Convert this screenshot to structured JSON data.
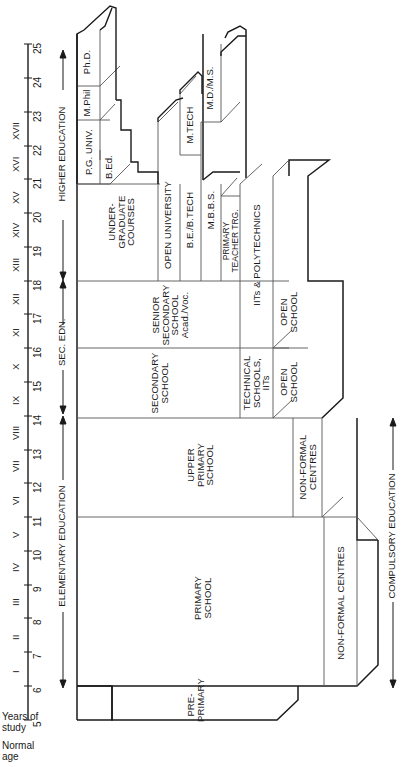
{
  "axis": {
    "years_label": "Years of\nstudy",
    "age_label": "Normal\nage",
    "ages": [
      "5",
      "6",
      "7",
      "8",
      "9",
      "10",
      "11",
      "12",
      "13",
      "14",
      "15",
      "16",
      "17",
      "18",
      "19",
      "20",
      "21",
      "22",
      "23",
      "24",
      "25"
    ],
    "years": [
      "I",
      "II",
      "III",
      "IV",
      "V",
      "VI",
      "VII",
      "VIII",
      "IX",
      "X",
      "XI",
      "XII",
      "XIII",
      "XIV",
      "XV",
      "XVI",
      "XVII"
    ]
  },
  "bands": {
    "elementary": "ELEMENTARY EDUCATION",
    "secondary": "SEC. EDN.",
    "higher": "HIGHER EDUCATION",
    "compulsory": "COMPULSORY EDUCATION"
  },
  "blocks": {
    "pre_primary": "PRE-\nPRIMARY",
    "primary_school": "PRIMARY\nSCHOOL",
    "primary_nonformal": "NON-FORMAL CENTRES",
    "upper_primary": "UPPER\nPRIMARY\nSCHOOL",
    "upper_nonformal": "NON-FORMAL\nCENTRES",
    "secondary_school": "SECONDARY\nSCHOOL",
    "technical_schools": "TECHNICAL\nSCHOOLS,\nIITs",
    "secondary_open_school": "OPEN\nSCHOOL",
    "senior_secondary": "SENIOR\nSECONDARY\nSCHOOL\nAcad./Voc.",
    "iits_polytechnics": "IITs & POLYTECHNICS",
    "senior_open_school": "OPEN\nSCHOOL",
    "undergraduate": "UNDER-\nGRADUATE\nCOURSES",
    "open_university": "OPEN UNIVERSITY",
    "be_btech": "B.E./B.TECH",
    "mbbs": "M.B.B.S.",
    "primary_teacher": "PRIMARY\nTEACHER TRG.",
    "pg_univ": "P.G. UNIV.",
    "bed": "B.Ed.",
    "mphil": "M.Phil",
    "phd": "Ph.D.",
    "mtech": "M.TECH",
    "md_ms": "M.D./M.S."
  },
  "colors": {
    "line": "#1a1a1a",
    "thin_line": "#555555",
    "background": "#ffffff"
  }
}
